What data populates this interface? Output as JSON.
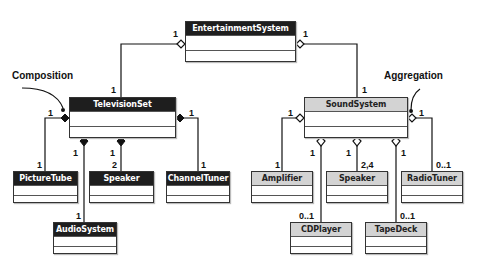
{
  "annotations": {
    "composition": "Composition",
    "aggregation": "Aggregation"
  },
  "classes": {
    "entertainment_system": "EntertainmentSystem",
    "television_set": "TelevisionSet",
    "sound_system": "SoundSystem",
    "picture_tube": "PictureTube",
    "tv_speaker": "Speaker",
    "channel_tuner": "ChannelTuner",
    "audio_system": "AudioSystem",
    "amplifier": "Amplifier",
    "sound_speaker": "Speaker",
    "radio_tuner": "RadioTuner",
    "cd_player": "CDPlayer",
    "tape_deck": "TapeDeck"
  },
  "multiplicities": {
    "es_tv_whole": "1",
    "es_tv_part": "1",
    "es_ss_whole": "1",
    "es_ss_part": "1",
    "tv_picturetube_whole": "1",
    "tv_picturetube_part": "1",
    "tv_audiosystem_whole": "1",
    "tv_audiosystem_part": "1",
    "tv_speaker_whole": "1",
    "tv_speaker_part": "2",
    "tv_channeltuner_whole": "1",
    "tv_channeltuner_part": "1",
    "ss_amplifier_whole": "1",
    "ss_amplifier_part": "1",
    "ss_cdplayer_whole": "1",
    "ss_cdplayer_part": "0..1",
    "ss_speaker_whole": "1",
    "ss_speaker_part": "2,4",
    "ss_tapedeck_whole": "1",
    "ss_tapedeck_part": "0..1",
    "ss_radiotuner_whole": "1",
    "ss_radiotuner_part": "0..1"
  },
  "colors": {
    "dark_header": "#1e1e1e",
    "light_header": "#d3d3d3",
    "line": "#111111"
  }
}
